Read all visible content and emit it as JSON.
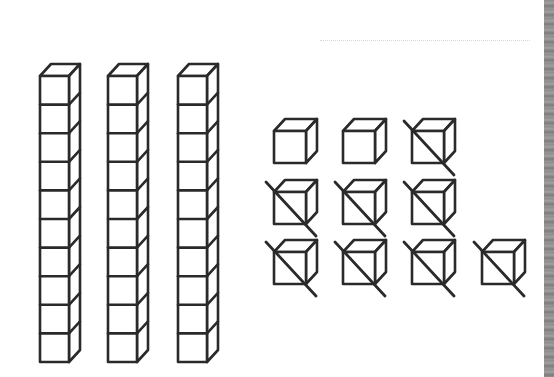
{
  "diagram": {
    "stroke_color": "#2a2a2a",
    "rods": {
      "count": 3,
      "cubes_per_rod": 10,
      "positions": [
        {
          "x": 40,
          "top": 76
        },
        {
          "x": 108,
          "top": 76
        },
        {
          "x": 178,
          "top": 76
        }
      ],
      "cube_width": 29,
      "cube_height": 28.6,
      "depth_dx": 11,
      "depth_dy": 12
    },
    "units": {
      "total": 10,
      "crossed_out": 8,
      "remaining": 2,
      "size": 32,
      "depth_dx": 11,
      "depth_dy": 12,
      "items": [
        {
          "x": 274,
          "y": 131,
          "crossed": false
        },
        {
          "x": 343,
          "y": 131,
          "crossed": false
        },
        {
          "x": 412,
          "y": 131,
          "crossed": true
        },
        {
          "x": 274,
          "y": 192,
          "crossed": true
        },
        {
          "x": 343,
          "y": 192,
          "crossed": true
        },
        {
          "x": 412,
          "y": 192,
          "crossed": true
        },
        {
          "x": 274,
          "y": 252,
          "crossed": true
        },
        {
          "x": 343,
          "y": 252,
          "crossed": true
        },
        {
          "x": 412,
          "y": 252,
          "crossed": true
        },
        {
          "x": 482,
          "y": 252,
          "crossed": true
        }
      ]
    }
  }
}
